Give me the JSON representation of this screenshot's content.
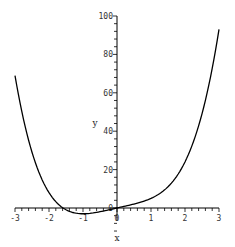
{
  "chart_data": {
    "type": "line",
    "title": "",
    "xlabel": "x",
    "ylabel": "y",
    "xlim": [
      -3,
      3
    ],
    "ylim": [
      0,
      100
    ],
    "grid": false,
    "legend": null,
    "x_ticks": [
      -3,
      -2,
      -1,
      0,
      1,
      2,
      3
    ],
    "y_ticks": [
      0,
      20,
      40,
      60,
      80,
      100
    ],
    "series": [
      {
        "name": "y = x^4 + 4x",
        "color": "#000000",
        "x": [
          -3,
          -2.5,
          -2,
          -1.5,
          -1,
          -0.5,
          0,
          0.5,
          1,
          1.5,
          2,
          2.5,
          3
        ],
        "y": [
          69,
          29.06,
          8,
          -0.94,
          -3,
          -1.94,
          0,
          2.06,
          5,
          11.06,
          24,
          49.06,
          93
        ]
      }
    ]
  },
  "axes": {
    "x_label": "x",
    "y_label": "y",
    "x_tick_labels": [
      "-3",
      "-2",
      "-1",
      "0",
      "1",
      "2",
      "3"
    ],
    "y_tick_labels": [
      "0",
      "20",
      "40",
      "60",
      "80",
      "100"
    ]
  }
}
